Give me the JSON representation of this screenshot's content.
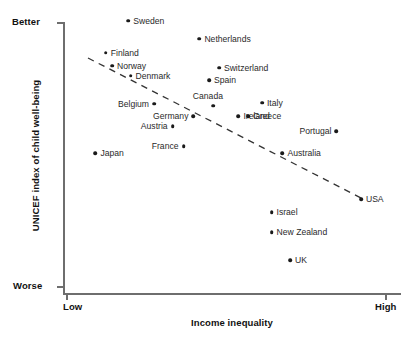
{
  "chart_data": {
    "type": "scatter",
    "title": "",
    "xlabel": "Income inequality",
    "ylabel": "UNICEF index of child well-being",
    "x_tick_labels": [
      "Low",
      "High"
    ],
    "y_tick_labels": [
      "Better",
      "Worse"
    ],
    "grid": false,
    "legend": "none",
    "xlim": [
      "Low",
      "High"
    ],
    "ylim": [
      "Worse",
      "Better"
    ],
    "trendline": {
      "style": "dashed",
      "direction": "negative",
      "description": "Dashed downward-sloping regression line from upper-left to lower-right ending at USA"
    },
    "points": [
      {
        "label": "Sweden",
        "x": 0.185,
        "y": 0.998,
        "label_side": "right"
      },
      {
        "label": "Netherlands",
        "x": 0.4,
        "y": 0.931,
        "label_side": "right"
      },
      {
        "label": "Finland",
        "x": 0.117,
        "y": 0.879,
        "label_side": "right"
      },
      {
        "label": "Norway",
        "x": 0.136,
        "y": 0.83,
        "label_side": "right"
      },
      {
        "label": "Denmark",
        "x": 0.192,
        "y": 0.793,
        "label_side": "right"
      },
      {
        "label": "Switzerland",
        "x": 0.459,
        "y": 0.823,
        "label_side": "right"
      },
      {
        "label": "Spain",
        "x": 0.429,
        "y": 0.778,
        "label_side": "right"
      },
      {
        "label": "Belgium",
        "x": 0.263,
        "y": 0.69,
        "label_side": "left"
      },
      {
        "label": "Canada",
        "x": 0.441,
        "y": 0.682,
        "label_side": "above"
      },
      {
        "label": "Italy",
        "x": 0.589,
        "y": 0.693,
        "label_side": "right"
      },
      {
        "label": "Germany",
        "x": 0.382,
        "y": 0.644,
        "label_side": "left"
      },
      {
        "label": "Ireland",
        "x": 0.518,
        "y": 0.644,
        "label_side": "right"
      },
      {
        "label": "Greece",
        "x": 0.547,
        "y": 0.644,
        "label_side": "right"
      },
      {
        "label": "Austria",
        "x": 0.319,
        "y": 0.607,
        "label_side": "left"
      },
      {
        "label": "Portugal",
        "x": 0.814,
        "y": 0.589,
        "label_side": "left"
      },
      {
        "label": "France",
        "x": 0.352,
        "y": 0.533,
        "label_side": "left"
      },
      {
        "label": "Australia",
        "x": 0.651,
        "y": 0.507,
        "label_side": "right"
      },
      {
        "label": "Japan",
        "x": 0.086,
        "y": 0.507,
        "label_side": "right"
      },
      {
        "label": "USA",
        "x": 0.888,
        "y": 0.336,
        "label_side": "right"
      },
      {
        "label": "Israel",
        "x": 0.618,
        "y": 0.288,
        "label_side": "right"
      },
      {
        "label": "New Zealand",
        "x": 0.618,
        "y": 0.214,
        "label_side": "right"
      },
      {
        "label": "UK",
        "x": 0.674,
        "y": 0.111,
        "label_side": "right"
      }
    ]
  },
  "axes": {
    "y_top_label": "Better",
    "y_bottom_label": "Worse",
    "x_left_label": "Low",
    "x_right_label": "High",
    "y_title": "UNICEF index of child well-being",
    "x_title": "Income inequality"
  },
  "colors": {
    "point": "#1a1a1a",
    "axis": "#6e6e6e",
    "text": "#111111",
    "label_text": "#2a2a2a",
    "trendline": "#333333",
    "background": "#ffffff"
  }
}
